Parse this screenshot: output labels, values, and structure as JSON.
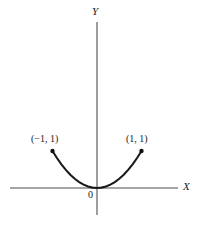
{
  "figure": {
    "background_color": "#ffffff",
    "stroke_color": "#1a1a1a",
    "axis_color": "#4d4d4d",
    "width": 201,
    "height": 228
  },
  "axes": {
    "y_label": "Y",
    "x_label": "X",
    "origin_label": "0"
  },
  "annotations": {
    "left_point_label": "(−1, 1)",
    "right_point_label": "(1, 1)"
  },
  "chart_data": {
    "type": "line",
    "title": "",
    "xlabel": "X",
    "ylabel": "Y",
    "grid": false,
    "legend": "none",
    "xlim": [
      -1.95,
      1.85
    ],
    "ylim": [
      -0.3,
      1.8
    ],
    "series": [
      {
        "name": "y = x^2",
        "equation": "y = x^2",
        "x": [
          -1.0,
          -0.9,
          -0.8,
          -0.7,
          -0.6,
          -0.5,
          -0.4,
          -0.3,
          -0.2,
          -0.1,
          0.0,
          0.1,
          0.2,
          0.3,
          0.4,
          0.5,
          0.6,
          0.7,
          0.8,
          0.9,
          1.0
        ],
        "y": [
          1.0,
          0.81,
          0.64,
          0.49,
          0.36,
          0.25,
          0.16,
          0.09,
          0.04,
          0.01,
          0.0,
          0.01,
          0.04,
          0.09,
          0.16,
          0.25,
          0.36,
          0.49,
          0.64,
          0.81,
          1.0
        ]
      }
    ],
    "markers": [
      {
        "label": "(−1, 1)",
        "x": -1,
        "y": 1
      },
      {
        "label": "(1, 1)",
        "x": 1,
        "y": 1
      }
    ],
    "vertex": {
      "x": 0,
      "y": 0
    }
  }
}
